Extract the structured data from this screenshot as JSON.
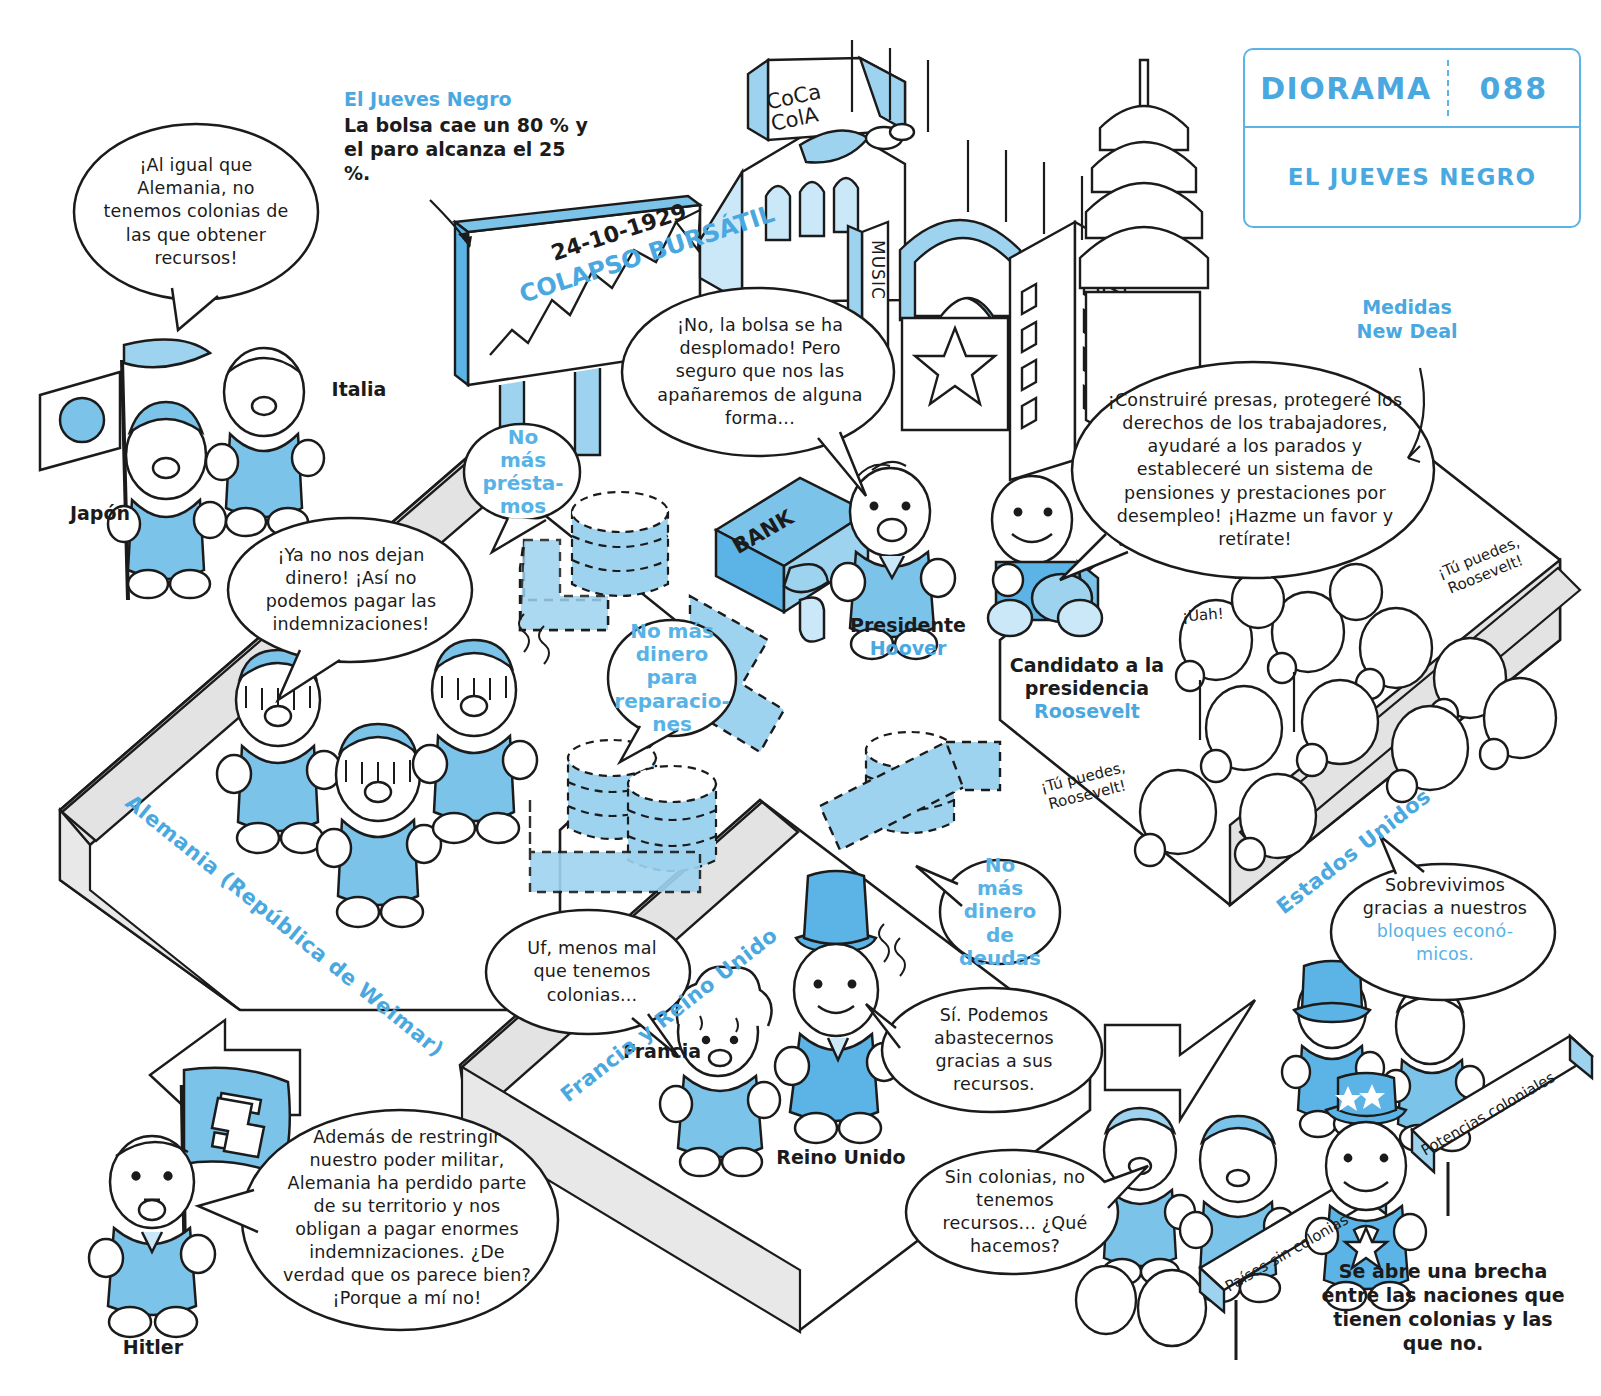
{
  "badge": {
    "label": "DIORAMA",
    "number": "088",
    "title": "EL JUEVES NEGRO"
  },
  "annotations": {
    "black_thursday_head": "El Jueves Negro",
    "black_thursday_body": "La bolsa cae un 80 % y el paro alcanza el 25 %.",
    "new_deal_head": "Medidas New Deal",
    "bottom_note": "Se abre una brecha entre las naciones que tienen colonias y las que no."
  },
  "billboard": {
    "date": "24-10-1929",
    "caption": "COLAPSO BURSÁTIL"
  },
  "city": {
    "coca_cola": "CoCa ColA",
    "music": "MUSIC",
    "bank": "BANK"
  },
  "ground_labels": {
    "germany": "Alemania (República de Weimar)",
    "france_uk": "Francia y Reino Unido",
    "usa": "Estados Unidos"
  },
  "characters": {
    "japan": "Japón",
    "italy": "Italia",
    "hitler": "Hitler",
    "france": "Francia",
    "uk": "Reino Unido",
    "hoover_title": "Presidente",
    "hoover_name": "Hoover",
    "roosevelt_title": "Candidato a la presidencia",
    "roosevelt_name": "Roosevelt"
  },
  "bubbles": {
    "italy": "¡Al igual que Alemania, no tenemos colonias de las que obtener recursos!",
    "germany_citizens": "¡Ya no nos dejan dinero! ¡Así no podemos pagar las indemnizaciones!",
    "hoover": "¡No, la bolsa se ha desplomado! Pero seguro que nos las apañaremos de alguna forma...",
    "roosevelt": "¡Construiré presas, protegeré los derechos de los trabajadores, ayudaré a los parados y estableceré un sistema de pensiones y prestaciones por desempleo! ¡Hazme un favor y retírate!",
    "hitler": "Además de restringir nuestro poder militar, Alemania ha perdido parte de su territorio y nos obligan a pagar enormes indemnizaciones. ¿De verdad que os parece bien? ¡Porque a mí no!",
    "france": "Uf, menos mal que tenemos colonias...",
    "uk": "Sí. Podemos abastecernos gracias a sus recursos.",
    "no_colonies": "Sin colonias, no tenemos recursos... ¿Qué hacemos?",
    "usa_survive_a": "Sobrevivimos gracias a nuestros",
    "usa_survive_blue": "bloques econó-micos.",
    "no_loans": "No más présta-mos",
    "no_reparations": "No más dinero para reparacio-nes",
    "no_debt": "No más dinero de deudas"
  },
  "crowd": {
    "cheer": "¡Uah!",
    "chant_1": "¡Tú puedes, Roosevelt!",
    "chant_2": "¡Tú puedes, Roosevelt!"
  },
  "signs": {
    "no_colonies": "Países sin colonias",
    "colonial_powers": "Potencias coloniales"
  },
  "colors": {
    "accent_blue": "#4aa8e0",
    "fill_blue": "#9ed3f0",
    "light_blue": "#cbe8f8",
    "ground_gray": "#e3e3e3",
    "ink": "#1b1b1b"
  }
}
